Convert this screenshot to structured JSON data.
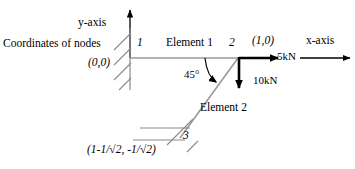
{
  "figure": {
    "annotations": {
      "coordinates_of_nodes": "Coordinates of nodes",
      "y_axis": "y-axis",
      "x_axis": "x-axis",
      "angle": "45°"
    },
    "nodes": [
      {
        "id": "1",
        "label": "1",
        "coordinate_label": "(0,0)",
        "support": "fixed-hatched",
        "x": 130,
        "y": 58
      },
      {
        "id": "2",
        "label": "2",
        "coordinate_label": "(1,0)",
        "support": "none",
        "x": 238,
        "y": 58
      },
      {
        "id": "3",
        "label": "3",
        "coordinate_label": "(1-1/√2, -1/√2)",
        "support": "roller-inclined",
        "x": 180,
        "y": 138
      }
    ],
    "elements": [
      {
        "id": "1",
        "label": "Element 1",
        "from": "1",
        "to": "2",
        "orientation": "horizontal"
      },
      {
        "id": "2",
        "label": "Element 2",
        "from": "2",
        "to": "3",
        "orientation": "diagonal-45"
      }
    ],
    "forces": [
      {
        "id": "horizontal-load",
        "label": "5kN",
        "magnitude": 5,
        "unit": "kN",
        "direction": "right",
        "applied_at_node": "2"
      },
      {
        "id": "vertical-load",
        "label": "10kN",
        "magnitude": 10,
        "unit": "kN",
        "direction": "down",
        "applied_at_node": "2"
      }
    ],
    "colors": {
      "member": "#9a9a9a",
      "force": "#000000",
      "support": "#7d7d7d",
      "axis": "#000000",
      "text": "#000000"
    }
  }
}
